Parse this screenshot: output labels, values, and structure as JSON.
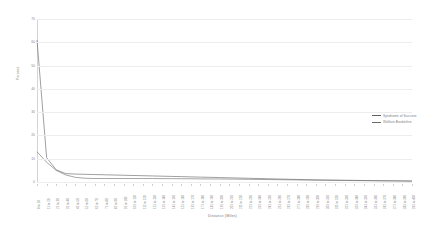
{
  "chart_data": {
    "type": "line",
    "title": "",
    "xlabel": "Distance (Miles)",
    "ylabel": "Percent",
    "ylim": [
      0,
      70
    ],
    "yticks": [
      0,
      10,
      20,
      30,
      40,
      50,
      60,
      70
    ],
    "grid": true,
    "legend_position": "right",
    "categories": [
      "0 to 10",
      "11 to 20",
      "21 to 30",
      "31 to 40",
      "41 to 50",
      "51 to 60",
      "61 to 70",
      "71 to 80",
      "81 to 90",
      "91 to 100",
      "101 to 110",
      "111 to 120",
      "121 to 130",
      "131 to 140",
      "141 to 150",
      "151 to 160",
      "161 to 170",
      "171 to 180",
      "181 to 190",
      "191 to 200",
      "201 to 210",
      "211 to 220",
      "221 to 230",
      "231 to 240",
      "241 to 250",
      "251 to 260",
      "261 to 270",
      "271 to 280",
      "281 to 290",
      "291 to 300",
      "301 to 310",
      "311 to 320",
      "321 to 330",
      "331 to 340",
      "341 to 350",
      "351 to 360",
      "361 to 370",
      "371 to 380",
      "381 to 390",
      "391 to 400"
    ],
    "series": [
      {
        "name": "Syndrome of Success",
        "color": "#5f5f5f",
        "values": [
          61.0,
          10.5,
          5.2,
          3.6,
          3.4,
          3.3,
          3.2,
          3.1,
          3.0,
          2.9,
          2.8,
          2.7,
          2.6,
          2.5,
          2.4,
          2.3,
          2.2,
          2.1,
          2.0,
          1.9,
          1.8,
          1.7,
          1.6,
          1.5,
          1.4,
          1.3,
          1.2,
          1.1,
          1.0,
          0.9,
          0.85,
          0.8,
          0.75,
          0.7,
          0.65,
          0.6,
          0.55,
          0.5,
          0.45,
          0.4
        ]
      },
      {
        "name": "Welfare Borderline",
        "color": "#6b6b6b",
        "values": [
          13.0,
          8.5,
          5.0,
          3.0,
          2.0,
          1.6,
          1.5,
          1.5,
          1.5,
          1.5,
          1.5,
          1.5,
          1.5,
          1.45,
          1.45,
          1.4,
          1.4,
          1.35,
          1.3,
          1.3,
          1.25,
          1.2,
          1.15,
          1.1,
          1.05,
          1.0,
          0.95,
          0.9,
          0.85,
          0.8,
          0.75,
          0.7,
          0.65,
          0.6,
          0.58,
          0.55,
          0.5,
          0.48,
          0.45,
          0.4
        ]
      }
    ]
  }
}
